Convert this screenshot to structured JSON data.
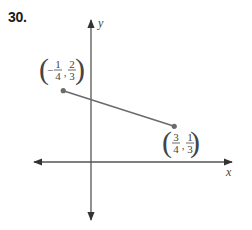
{
  "problem_number": "30.",
  "chart_data": {
    "type": "line",
    "title": "",
    "xlabel": "x",
    "ylabel": "y",
    "grid": false,
    "axis_arrows": true,
    "xlim": [
      -0.6,
      1.4
    ],
    "ylim": [
      -0.6,
      1.4
    ],
    "series": [
      {
        "name": "segment",
        "points": [
          {
            "x": -0.25,
            "y": 0.6667,
            "label": {
              "sign": "-",
              "xnum": "1",
              "xden": "4",
              "ysign": "",
              "ynum": "2",
              "yden": "3"
            }
          },
          {
            "x": 0.75,
            "y": 0.3333,
            "label": {
              "sign": "",
              "xnum": "3",
              "xden": "4",
              "ysign": "",
              "ynum": "1",
              "yden": "3"
            }
          }
        ]
      }
    ]
  }
}
